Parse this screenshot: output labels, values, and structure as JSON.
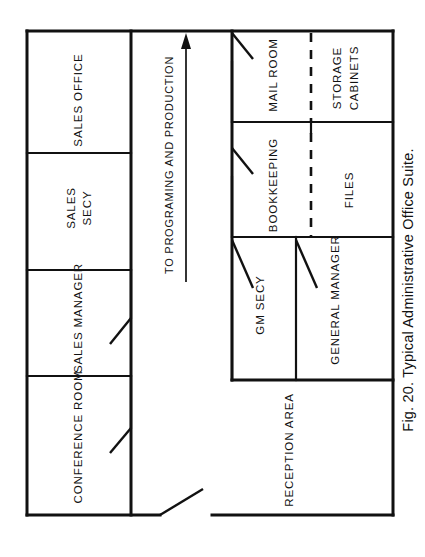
{
  "figure": {
    "caption": "Fig. 20.  Typical Administrative Office Suite.",
    "caption_number": "Fig. 20.",
    "caption_title": "Typical Administrative Office Suite.",
    "orientation": "rotated-90-ccw",
    "ink_color": "#111111",
    "paper_color": "#ffffff"
  },
  "plan": {
    "type": "architectural-floor-plan",
    "outer_wall": {
      "x": 27,
      "y": 31,
      "width": 366,
      "height": 484
    },
    "rooms": [
      {
        "id": "sales-office",
        "label": "SALES OFFICE",
        "cx": 79,
        "cy": 100,
        "wing": "left"
      },
      {
        "id": "sales-secy",
        "label": "SALES SECY",
        "cx": 79,
        "cy": 208,
        "wing": "left",
        "lines": [
          "SALES",
          "SECY"
        ]
      },
      {
        "id": "sales-manager",
        "label": "SALES MANAGER",
        "cx": 79,
        "cy": 318,
        "wing": "left"
      },
      {
        "id": "conference-room",
        "label": "CONFERENCE ROOM",
        "cx": 79,
        "cy": 437,
        "wing": "left"
      },
      {
        "id": "mail-room",
        "label": "MAIL ROOM",
        "cx": 274,
        "cy": 75,
        "wing": "right"
      },
      {
        "id": "storage-cabinets",
        "label": "STORAGE CABINETS",
        "cx": 345,
        "cy": 78,
        "wing": "right",
        "lines": [
          "STORAGE",
          "CABINETS"
        ]
      },
      {
        "id": "bookkeeping",
        "label": "BOOKKEEPING",
        "cx": 274,
        "cy": 185,
        "wing": "right"
      },
      {
        "id": "files",
        "label": "FILES",
        "cx": 350,
        "cy": 190,
        "wing": "right"
      },
      {
        "id": "gm-secy",
        "label": "GM SECY",
        "cx": 261,
        "cy": 305,
        "wing": "right"
      },
      {
        "id": "general-manager",
        "label": "GENERAL MANAGER",
        "cx": 336,
        "cy": 300,
        "wing": "right"
      },
      {
        "id": "reception-area",
        "label": "RECEPTION AREA",
        "cx": 295,
        "cy": 450,
        "wing": "right"
      }
    ],
    "corridor": {
      "id": "main-corridor",
      "flow_label": "TO PROGRAMING AND PRODUCTION",
      "arrow_direction": "up",
      "x_left": 131,
      "x_right": 232
    },
    "partitions": [
      {
        "id": "mail-room-storage-divider",
        "style": "dashed"
      },
      {
        "id": "bookkeeping-files-divider",
        "style": "dashed"
      }
    ],
    "doors": [
      {
        "id": "door-mail-room",
        "serves": "mail-room"
      },
      {
        "id": "door-bookkeeping",
        "serves": "bookkeeping"
      },
      {
        "id": "door-gm-secy",
        "serves": "gm-secy"
      },
      {
        "id": "door-general-manager",
        "serves": "general-manager"
      },
      {
        "id": "door-sales-manager",
        "serves": "sales-manager"
      },
      {
        "id": "door-conference-room",
        "serves": "conference-room"
      },
      {
        "id": "door-suite-entrance",
        "serves": "reception-area"
      }
    ]
  }
}
